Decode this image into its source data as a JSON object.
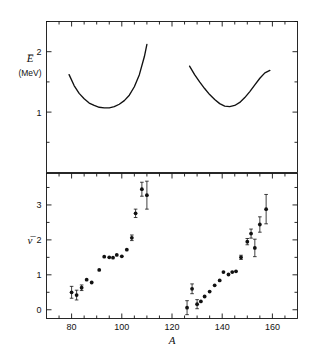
{
  "figure": {
    "background": "#ffffff",
    "ink": "#111111",
    "xlabel": "A",
    "x_ticks_major": [
      80,
      100,
      120,
      140,
      160
    ],
    "x_ticks_minor": [
      70,
      75,
      85,
      90,
      95,
      105,
      110,
      115,
      125,
      130,
      135,
      145,
      150,
      155,
      165,
      170
    ],
    "xlim": [
      70,
      170
    ]
  },
  "panel_top": {
    "ylabel": "E̅",
    "yunit": "(MeV)",
    "y_ticks_major": [
      1,
      2
    ],
    "y_ticks_minor": [
      0.5,
      1.5,
      2.5
    ],
    "ylim": [
      0,
      2.5
    ],
    "tick_labels": [
      "1",
      "2"
    ]
  },
  "panel_bottom": {
    "ylabel": "ν̅",
    "y_ticks_major": [
      0,
      1,
      2,
      3
    ],
    "y_ticks_minor": [
      0.5,
      1.5,
      2.5,
      3.5
    ],
    "ylim": [
      -0.25,
      3.9
    ],
    "tick_labels": [
      "0",
      "1",
      "2",
      "3"
    ]
  },
  "chart_data": [
    {
      "type": "line",
      "title": "Average total excitation energy versus fragment mass",
      "name": "E-bar curves",
      "xlabel": "A",
      "ylabel": "E̅ (MeV)",
      "xlim": [
        70,
        170
      ],
      "ylim": [
        0,
        2.5
      ],
      "grid": false,
      "legend": "none",
      "series": [
        {
          "name": "light-fragment branch",
          "x": [
            79,
            81,
            83,
            85,
            87,
            89,
            91,
            93,
            95,
            97,
            99,
            101,
            103,
            105,
            107,
            109,
            110
          ],
          "y": [
            1.62,
            1.44,
            1.31,
            1.22,
            1.15,
            1.11,
            1.08,
            1.07,
            1.07,
            1.09,
            1.13,
            1.19,
            1.28,
            1.42,
            1.62,
            1.92,
            2.12
          ]
        },
        {
          "name": "heavy-fragment branch",
          "x": [
            127,
            129,
            131,
            133,
            135,
            137,
            139,
            141,
            143,
            145,
            147,
            149,
            151,
            153,
            155,
            157,
            159
          ],
          "y": [
            1.76,
            1.62,
            1.5,
            1.39,
            1.29,
            1.21,
            1.14,
            1.1,
            1.09,
            1.11,
            1.16,
            1.24,
            1.34,
            1.45,
            1.56,
            1.65,
            1.69
          ]
        }
      ]
    },
    {
      "type": "scatter",
      "title": "Average neutron multiplicity versus fragment mass",
      "name": "nu-bar data",
      "xlabel": "A",
      "ylabel": "ν̅",
      "xlim": [
        70,
        170
      ],
      "ylim": [
        -0.25,
        3.9
      ],
      "grid": false,
      "legend": "none",
      "error_bars": "vertical, asymmetric-capped",
      "points": [
        {
          "x": 80.0,
          "y": 0.5,
          "yerr": 0.17
        },
        {
          "x": 82.0,
          "y": 0.42,
          "yerr": 0.14
        },
        {
          "x": 84.0,
          "y": 0.63,
          "yerr": 0.08
        },
        {
          "x": 86.0,
          "y": 0.86,
          "yerr": 0.0
        },
        {
          "x": 88.0,
          "y": 0.78,
          "yerr": 0.0
        },
        {
          "x": 91.0,
          "y": 1.14,
          "yerr": 0.0
        },
        {
          "x": 93.0,
          "y": 1.52,
          "yerr": 0.0
        },
        {
          "x": 95.0,
          "y": 1.5,
          "yerr": 0.0
        },
        {
          "x": 96.5,
          "y": 1.49,
          "yerr": 0.0
        },
        {
          "x": 98.0,
          "y": 1.57,
          "yerr": 0.0
        },
        {
          "x": 100.0,
          "y": 1.53,
          "yerr": 0.0
        },
        {
          "x": 102.0,
          "y": 1.72,
          "yerr": 0.0
        },
        {
          "x": 104.0,
          "y": 2.06,
          "yerr": 0.08
        },
        {
          "x": 105.5,
          "y": 2.76,
          "yerr": 0.12
        },
        {
          "x": 108.0,
          "y": 3.45,
          "yerr": 0.2
        },
        {
          "x": 110.0,
          "y": 3.28,
          "yerr": 0.4
        },
        {
          "x": 126.0,
          "y": 0.06,
          "yerr": 0.2
        },
        {
          "x": 128.0,
          "y": 0.6,
          "yerr": 0.14
        },
        {
          "x": 130.0,
          "y": 0.16,
          "yerr": 0.13
        },
        {
          "x": 131.5,
          "y": 0.24,
          "yerr": 0.0
        },
        {
          "x": 133.0,
          "y": 0.38,
          "yerr": 0.0
        },
        {
          "x": 135.0,
          "y": 0.52,
          "yerr": 0.0
        },
        {
          "x": 137.0,
          "y": 0.7,
          "yerr": 0.0
        },
        {
          "x": 139.0,
          "y": 0.84,
          "yerr": 0.0
        },
        {
          "x": 140.5,
          "y": 1.08,
          "yerr": 0.0
        },
        {
          "x": 142.5,
          "y": 1.01,
          "yerr": 0.0
        },
        {
          "x": 144.0,
          "y": 1.08,
          "yerr": 0.0
        },
        {
          "x": 145.5,
          "y": 1.1,
          "yerr": 0.0
        },
        {
          "x": 147.5,
          "y": 1.5,
          "yerr": 0.06
        },
        {
          "x": 150.0,
          "y": 1.95,
          "yerr": 0.09
        },
        {
          "x": 151.5,
          "y": 2.18,
          "yerr": 0.13
        },
        {
          "x": 153.0,
          "y": 1.77,
          "yerr": 0.25
        },
        {
          "x": 155.0,
          "y": 2.44,
          "yerr": 0.22
        },
        {
          "x": 157.5,
          "y": 2.88,
          "yerr": 0.42
        }
      ]
    }
  ]
}
